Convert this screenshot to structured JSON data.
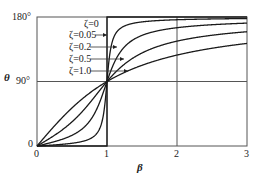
{
  "chart_data": {
    "type": "line",
    "title": "",
    "xlabel": "β",
    "ylabel": "θ",
    "xlim": [
      0,
      3
    ],
    "ylim": [
      0,
      180
    ],
    "x_ticks": [
      "0",
      "1",
      "2",
      "3"
    ],
    "y_ticks": [
      "0",
      "90°",
      "180°"
    ],
    "grid": true,
    "legend_position": "inline-top-left",
    "series": [
      {
        "name": "ζ=0",
        "zeta": 0,
        "x": [
          0,
          0.999,
          1.001,
          3
        ],
        "values": [
          0,
          0,
          180,
          180
        ]
      },
      {
        "name": "ζ=0.05",
        "zeta": 0.05,
        "x": [
          0,
          0.5,
          0.8,
          0.9,
          1.0,
          1.1,
          1.2,
          1.5,
          2,
          3
        ],
        "values": [
          0,
          3.8,
          12.5,
          25.3,
          90,
          152.4,
          164.7,
          175.4,
          176.2,
          177.1
        ]
      },
      {
        "name": "ζ=0.2",
        "zeta": 0.2,
        "x": [
          0,
          0.5,
          0.8,
          0.9,
          1.0,
          1.1,
          1.2,
          1.5,
          2,
          3
        ],
        "values": [
          0,
          14.9,
          41.6,
          62.9,
          90,
          115.1,
          132.5,
          154.4,
          165.1,
          171.5
        ]
      },
      {
        "name": "ζ=0.5",
        "zeta": 0.5,
        "x": [
          0,
          0.5,
          0.8,
          0.9,
          1.0,
          1.1,
          1.2,
          1.5,
          2,
          3
        ],
        "values": [
          0,
          33.7,
          65.8,
          78.1,
          90,
          100.4,
          110.2,
          129.8,
          146.3,
          159.4
        ]
      },
      {
        "name": "ζ=1.0",
        "zeta": 1.0,
        "x": [
          0,
          0.5,
          0.8,
          0.9,
          1.0,
          1.1,
          1.2,
          1.5,
          2,
          3
        ],
        "values": [
          0,
          53.1,
          77.3,
          83.9,
          90,
          95.5,
          100.4,
          112.6,
          126.9,
          143.1
        ]
      }
    ]
  },
  "labels": {
    "y_180": "180°",
    "y_90": "90°",
    "y_0": "0",
    "x_0": "0",
    "x_1": "1",
    "x_2": "2",
    "x_3": "3",
    "xlabel": "β",
    "ylabel": "θ",
    "legend": [
      "ζ=0",
      "ζ=0.05",
      "ζ=0.2",
      "ζ=0.5",
      "ζ=1.0"
    ]
  }
}
